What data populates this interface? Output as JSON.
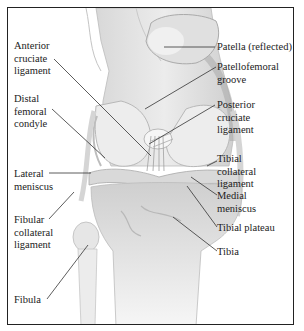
{
  "diagram": {
    "labels_left": [
      {
        "id": "acl",
        "text": "Anterior\ncruciate\nligament"
      },
      {
        "id": "dfc",
        "text": "Distal\nfemoral\ncondyle"
      },
      {
        "id": "lm",
        "text": "Lateral\nmeniscus"
      },
      {
        "id": "fcl",
        "text": "Fibular\ncollateral\nligament"
      },
      {
        "id": "fib",
        "text": "Fibula"
      }
    ],
    "labels_right": [
      {
        "id": "pat",
        "text": "Patella (reflected)"
      },
      {
        "id": "pfg",
        "text": "Patellofemoral\ngroove"
      },
      {
        "id": "pcl",
        "text": "Posterior\ncruciate\nligament"
      },
      {
        "id": "tcl",
        "text": "Tibial\ncollateral\nligament"
      },
      {
        "id": "mm",
        "text": "Medial\nmeniscus"
      },
      {
        "id": "tp",
        "text": "Tibial plateau"
      },
      {
        "id": "tib",
        "text": "Tibia"
      }
    ],
    "colors": {
      "border": "#222222",
      "bone_light": "#e9e9e9",
      "bone_mid": "#cfcfcf",
      "bone_dark": "#b5b5b5",
      "ligament": "#f2f2f2",
      "leader_line": "#333333",
      "text": "#222222"
    }
  }
}
